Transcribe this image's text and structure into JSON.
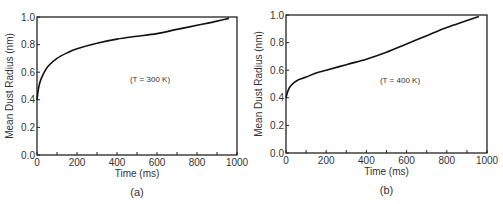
{
  "chart_data": [
    {
      "type": "line",
      "panel": "(a)",
      "title": "",
      "annotation": "(T = 300 K)",
      "xlabel": "Time (ms)",
      "ylabel": "Mean Dust Radius (nm)",
      "xlim": [
        0,
        1000
      ],
      "ylim": [
        0.0,
        1.0
      ],
      "xticks": [
        "0",
        "200",
        "400",
        "600",
        "800",
        "1000"
      ],
      "yticks": [
        "0.0",
        "0.2",
        "0.4",
        "0.6",
        "0.8",
        "1.0"
      ],
      "grid": false,
      "series": [
        {
          "name": "T = 300 K",
          "x": [
            0,
            5,
            10,
            20,
            40,
            60,
            100,
            150,
            200,
            300,
            400,
            500,
            600,
            700,
            800,
            900,
            960
          ],
          "y": [
            0.4,
            0.46,
            0.5,
            0.55,
            0.61,
            0.65,
            0.7,
            0.74,
            0.77,
            0.81,
            0.84,
            0.86,
            0.88,
            0.91,
            0.94,
            0.97,
            0.99
          ]
        }
      ]
    },
    {
      "type": "line",
      "panel": "(b)",
      "title": "",
      "annotation": "(T = 400 K)",
      "xlabel": "Time (ms)",
      "ylabel": "Mean Dust Radius (nm)",
      "xlim": [
        0,
        1000
      ],
      "ylim": [
        0.0,
        1.0
      ],
      "xticks": [
        "0",
        "200",
        "400",
        "600",
        "800",
        "1000"
      ],
      "yticks": [
        "0.0",
        "0.2",
        "0.4",
        "0.6",
        "0.8",
        "1.0"
      ],
      "grid": false,
      "series": [
        {
          "name": "T = 400 K",
          "x": [
            0,
            5,
            10,
            20,
            40,
            60,
            100,
            150,
            200,
            300,
            400,
            500,
            600,
            700,
            800,
            900,
            960
          ],
          "y": [
            0.4,
            0.43,
            0.45,
            0.48,
            0.51,
            0.53,
            0.55,
            0.58,
            0.6,
            0.64,
            0.68,
            0.73,
            0.79,
            0.85,
            0.91,
            0.96,
            0.99
          ]
        }
      ]
    }
  ]
}
